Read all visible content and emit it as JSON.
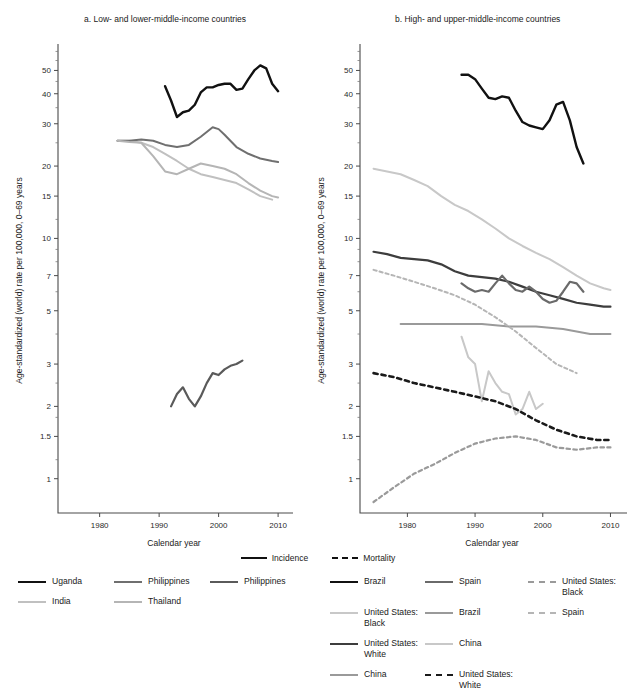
{
  "panels": {
    "a": {
      "title": "a. Low- and lower-middle-income countries"
    },
    "b": {
      "title": "b. High- and upper-middle-income countries"
    }
  },
  "axes": {
    "ylabel": "Age-standardized (world) rate per 100,000, 0–69 years",
    "xlabel": "Calendar year",
    "yticks": [
      1,
      1.5,
      2,
      3,
      5,
      7,
      10,
      15,
      20,
      30,
      40,
      50
    ],
    "yticklabels": [
      "1",
      "1.5",
      "2",
      "3",
      "5",
      "7",
      "10",
      "15",
      "20",
      "30",
      "40",
      "50"
    ],
    "xticks": [
      1980,
      1990,
      2000,
      2010
    ],
    "xticklabels": [
      "1980",
      "1990",
      "2000",
      "2010"
    ],
    "xlim": [
      1973,
      2012
    ],
    "ylim": [
      0.72,
      62
    ],
    "yscale": "log"
  },
  "legend_top": [
    {
      "label": "Incidence",
      "style": "solid",
      "color": "#111111"
    },
    {
      "label": "Mortality",
      "style": "dashed",
      "color": "#111111"
    }
  ],
  "legend_left": [
    {
      "label": "Uganda",
      "color": "#111111",
      "style": "solid",
      "width": 2.4
    },
    {
      "label": "India",
      "color": "#c0c0c0",
      "style": "solid",
      "width": 2.0
    },
    {
      "label": "Philippines",
      "color": "#6f6f6f",
      "style": "solid",
      "width": 2.0
    },
    {
      "label": "Thailand",
      "color": "#b5b5b5",
      "style": "solid",
      "width": 2.0
    },
    {
      "label": "Philippines",
      "color": "#5a5a5a",
      "style": "solid",
      "width": 2.2
    }
  ],
  "legend_right": [
    {
      "label": "Brazil",
      "color": "#111111",
      "style": "solid",
      "width": 2.4
    },
    {
      "label": "United States:\nBlack",
      "color": "#c8c8c8",
      "style": "solid",
      "width": 2.0
    },
    {
      "label": "United States:\nWhite",
      "color": "#3d3d3d",
      "style": "solid",
      "width": 2.2
    },
    {
      "label": "China",
      "color": "#9a9a9a",
      "style": "solid",
      "width": 2.0
    },
    {
      "label": "Spain",
      "color": "#6a6a6a",
      "style": "solid",
      "width": 2.2
    },
    {
      "label": "Brazil",
      "color": "#9a9a9a",
      "style": "solid",
      "width": 2.0
    },
    {
      "label": "China",
      "color": "#c8c8c8",
      "style": "solid",
      "width": 2.0
    },
    {
      "label": "United States:\nWhite",
      "color": "#1a1a1a",
      "style": "dashed",
      "width": 2.6
    },
    {
      "label": "United States:\nBlack",
      "color": "#9a9a9a",
      "style": "dashed",
      "width": 2.2
    },
    {
      "label": "Spain",
      "color": "#b5b5b5",
      "style": "dashed",
      "width": 2.0
    }
  ],
  "chart_data": [
    {
      "id": "panel-a",
      "type": "line",
      "title": "a. Low- and lower-middle-income countries",
      "xlabel": "Calendar year",
      "ylabel": "Age-standardized (world) rate per 100,000, 0–69 years",
      "yscale": "log",
      "xlim": [
        1973,
        2012
      ],
      "ylim": [
        0.72,
        62
      ],
      "grid": false,
      "series": [
        {
          "name": "Uganda",
          "measure": "Incidence",
          "color": "#111111",
          "style": "solid",
          "width": 2.4,
          "x": [
            1991,
            1992,
            1993,
            1994,
            1995,
            1996,
            1997,
            1998,
            1999,
            2000,
            2001,
            2002,
            2003,
            2004,
            2005,
            2006,
            2007,
            2008,
            2009,
            2010
          ],
          "y": [
            43.0,
            37.5,
            32.0,
            33.5,
            34.0,
            36.0,
            40.5,
            42.5,
            42.5,
            43.5,
            44.0,
            44.0,
            41.5,
            42.0,
            46.0,
            50.0,
            52.5,
            51.0,
            44.0,
            41.0
          ]
        },
        {
          "name": "India",
          "measure": "Incidence",
          "color": "#c0c0c0",
          "style": "solid",
          "width": 2.0,
          "x": [
            1983,
            1985,
            1987,
            1989,
            1991,
            1993,
            1995,
            1997,
            1999,
            2001,
            2003,
            2005,
            2007,
            2009
          ],
          "y": [
            25.5,
            25.5,
            25.0,
            24.0,
            22.5,
            21.0,
            19.5,
            18.5,
            18.0,
            17.5,
            17.0,
            16.0,
            15.0,
            14.5
          ]
        },
        {
          "name": "Philippines",
          "measure": "Incidence",
          "color": "#6f6f6f",
          "style": "solid",
          "width": 2.0,
          "x": [
            1983,
            1985,
            1987,
            1989,
            1991,
            1993,
            1995,
            1997,
            1999,
            2000,
            2001,
            2003,
            2005,
            2007,
            2009,
            2010
          ],
          "y": [
            25.5,
            25.5,
            25.8,
            25.5,
            24.5,
            24.0,
            24.5,
            26.5,
            29.0,
            28.5,
            27.0,
            24.0,
            22.5,
            21.5,
            21.0,
            20.8
          ]
        },
        {
          "name": "Thailand",
          "measure": "Incidence",
          "color": "#b5b5b5",
          "style": "solid",
          "width": 2.0,
          "x": [
            1983,
            1985,
            1987,
            1989,
            1991,
            1993,
            1995,
            1997,
            1999,
            2001,
            2003,
            2005,
            2007,
            2009,
            2010
          ],
          "y": [
            25.5,
            25.2,
            25.0,
            22.0,
            19.0,
            18.5,
            19.5,
            20.5,
            20.0,
            19.5,
            18.5,
            17.0,
            15.8,
            15.0,
            14.8
          ]
        },
        {
          "name": "Philippines",
          "measure": "Mortality",
          "color": "#5a5a5a",
          "style": "solid",
          "width": 2.2,
          "x": [
            1992,
            1993,
            1994,
            1995,
            1996,
            1997,
            1998,
            1999,
            2000,
            2001,
            2002,
            2003,
            2004
          ],
          "y": [
            2.0,
            2.25,
            2.4,
            2.15,
            2.0,
            2.2,
            2.5,
            2.75,
            2.7,
            2.85,
            2.95,
            3.0,
            3.1
          ]
        }
      ]
    },
    {
      "id": "panel-b",
      "type": "line",
      "title": "b. High- and upper-middle-income countries",
      "xlabel": "Calendar year",
      "ylabel": "Age-standardized (world) rate per 100,000, 0–69 years",
      "yscale": "log",
      "xlim": [
        1973,
        2012
      ],
      "ylim": [
        0.72,
        62
      ],
      "grid": false,
      "series": [
        {
          "name": "Brazil",
          "measure": "Incidence",
          "color": "#111111",
          "style": "solid",
          "width": 2.4,
          "x": [
            1988,
            1989,
            1990,
            1991,
            1992,
            1993,
            1994,
            1995,
            1996,
            1997,
            1998,
            1999,
            2000,
            2001,
            2002,
            2003,
            2004,
            2005,
            2006
          ],
          "y": [
            48.0,
            48.0,
            46.0,
            42.0,
            38.5,
            38.0,
            39.0,
            38.5,
            34.0,
            30.5,
            29.5,
            29.0,
            28.5,
            31.0,
            36.0,
            37.0,
            31.0,
            24.0,
            20.5
          ]
        },
        {
          "name": "United States: Black",
          "measure": "Incidence",
          "color": "#c8c8c8",
          "style": "solid",
          "width": 2.0,
          "x": [
            1975,
            1977,
            1979,
            1981,
            1983,
            1985,
            1987,
            1989,
            1991,
            1993,
            1995,
            1997,
            1999,
            2001,
            2003,
            2005,
            2007,
            2009,
            2010
          ],
          "y": [
            19.5,
            19.0,
            18.5,
            17.5,
            16.5,
            15.0,
            13.8,
            13.0,
            12.0,
            11.0,
            10.0,
            9.3,
            8.7,
            8.2,
            7.6,
            7.0,
            6.5,
            6.2,
            6.1
          ]
        },
        {
          "name": "United States: White",
          "measure": "Incidence",
          "color": "#3d3d3d",
          "style": "solid",
          "width": 2.2,
          "x": [
            1975,
            1977,
            1979,
            1981,
            1983,
            1985,
            1987,
            1989,
            1991,
            1993,
            1995,
            1997,
            1999,
            2001,
            2003,
            2005,
            2007,
            2009,
            2010
          ],
          "y": [
            8.8,
            8.6,
            8.3,
            8.2,
            8.1,
            7.8,
            7.3,
            7.0,
            6.9,
            6.8,
            6.6,
            6.3,
            6.0,
            5.8,
            5.6,
            5.4,
            5.3,
            5.2,
            5.2
          ]
        },
        {
          "name": "Spain",
          "measure": "Incidence",
          "color": "#6a6a6a",
          "style": "solid",
          "width": 2.2,
          "x": [
            1988,
            1989,
            1990,
            1991,
            1992,
            1993,
            1994,
            1995,
            1996,
            1997,
            1998,
            1999,
            2000,
            2001,
            2002,
            2003,
            2004,
            2005,
            2006
          ],
          "y": [
            6.5,
            6.2,
            6.0,
            6.1,
            6.0,
            6.5,
            7.0,
            6.5,
            6.1,
            6.0,
            6.3,
            6.0,
            5.6,
            5.4,
            5.5,
            6.0,
            6.6,
            6.5,
            6.0
          ]
        },
        {
          "name": "Brazil",
          "measure": "Incidence",
          "color": "#9a9a9a",
          "style": "solid",
          "width": 2.0,
          "x": [
            1979,
            1983,
            1987,
            1991,
            1995,
            1999,
            2003,
            2007,
            2010
          ],
          "y": [
            4.4,
            4.4,
            4.4,
            4.4,
            4.3,
            4.3,
            4.2,
            4.0,
            4.0
          ]
        },
        {
          "name": "China",
          "measure": "Incidence",
          "color": "#c8c8c8",
          "style": "solid",
          "width": 2.0,
          "x": [
            1988,
            1989,
            1990,
            1991,
            1992,
            1993,
            1994,
            1995,
            1996,
            1997,
            1998,
            1999,
            2000
          ],
          "y": [
            3.9,
            3.2,
            3.0,
            2.1,
            2.8,
            2.5,
            2.3,
            2.25,
            1.85,
            1.95,
            2.3,
            1.95,
            2.05
          ]
        },
        {
          "name": "United States: White",
          "measure": "Mortality",
          "color": "#1a1a1a",
          "style": "dashed",
          "width": 2.6,
          "x": [
            1975,
            1978,
            1981,
            1984,
            1987,
            1990,
            1993,
            1996,
            1999,
            2002,
            2005,
            2008,
            2010
          ],
          "y": [
            2.75,
            2.65,
            2.5,
            2.4,
            2.3,
            2.2,
            2.1,
            1.95,
            1.75,
            1.6,
            1.5,
            1.45,
            1.45
          ]
        },
        {
          "name": "United States: Black",
          "measure": "Mortality",
          "color": "#9a9a9a",
          "style": "dashed",
          "width": 2.2,
          "x": [
            1975,
            1978,
            1981,
            1984,
            1987,
            1990,
            1993,
            1996,
            1999,
            2002,
            2005,
            2008,
            2010
          ],
          "y": [
            0.8,
            0.92,
            1.05,
            1.15,
            1.28,
            1.4,
            1.47,
            1.5,
            1.45,
            1.35,
            1.32,
            1.35,
            1.35
          ]
        },
        {
          "name": "Spain",
          "measure": "Mortality",
          "color": "#b5b5b5",
          "style": "dashed",
          "width": 2.0,
          "x": [
            1975,
            1978,
            1981,
            1984,
            1987,
            1990,
            1993,
            1996,
            1999,
            2002,
            2005
          ],
          "y": [
            7.4,
            7.0,
            6.6,
            6.2,
            5.8,
            5.3,
            4.7,
            4.1,
            3.5,
            3.0,
            2.75
          ]
        }
      ]
    }
  ]
}
